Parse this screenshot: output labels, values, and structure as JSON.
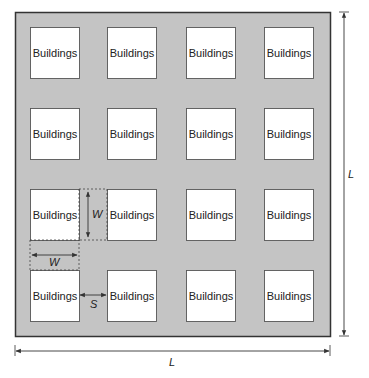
{
  "diagram": {
    "type": "urban-canopy-layout",
    "colors": {
      "ground": "#c4c4c4",
      "building_fill": "#ffffff",
      "outline": "#333333",
      "background": "#ffffff"
    },
    "grid": {
      "rows": 4,
      "cols": 4
    },
    "buildings": [
      {
        "row": 1,
        "col": 1,
        "label": "Buildings"
      },
      {
        "row": 1,
        "col": 2,
        "label": "Buildings"
      },
      {
        "row": 1,
        "col": 3,
        "label": "Buildings"
      },
      {
        "row": 1,
        "col": 4,
        "label": "Buildings"
      },
      {
        "row": 2,
        "col": 1,
        "label": "Buildings"
      },
      {
        "row": 2,
        "col": 2,
        "label": "Buildings"
      },
      {
        "row": 2,
        "col": 3,
        "label": "Buildings"
      },
      {
        "row": 2,
        "col": 4,
        "label": "Buildings"
      },
      {
        "row": 3,
        "col": 1,
        "label": "Buildings"
      },
      {
        "row": 3,
        "col": 2,
        "label": "Buildings"
      },
      {
        "row": 3,
        "col": 3,
        "label": "Buildings"
      },
      {
        "row": 3,
        "col": 4,
        "label": "Buildings"
      },
      {
        "row": 4,
        "col": 1,
        "label": "Buildings"
      },
      {
        "row": 4,
        "col": 2,
        "label": "Buildings"
      },
      {
        "row": 4,
        "col": 3,
        "label": "Buildings"
      },
      {
        "row": 4,
        "col": 4,
        "label": "Buildings"
      }
    ],
    "dimensions": {
      "domain_width_label": "L",
      "domain_height_label": "L",
      "building_width_label_horizontal": "W",
      "building_width_label_vertical": "W",
      "spacing_label": "S"
    }
  }
}
